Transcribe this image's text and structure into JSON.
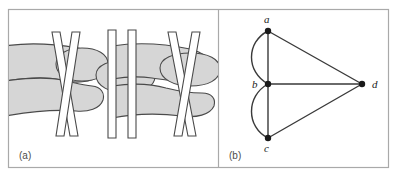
{
  "figure": {
    "border_color": "#a8a8a8",
    "background": "#ffffff"
  },
  "panels": [
    {
      "id": "a",
      "label": "(a)",
      "caption_position": "bottom-left",
      "description": "Shaded band with rounded bulges crossed by white strips",
      "fill_color": "#d6d6d6",
      "stroke_color": "#4a4a4a"
    },
    {
      "id": "b",
      "label": "(b)",
      "caption_position": "bottom-left",
      "description": "Graph with four vertices a, b, c, d and seven edges",
      "node_color": "#1a1a1a",
      "edge_color": "#3a3a3a"
    }
  ],
  "graph": {
    "nodes": [
      {
        "id": "a",
        "label": "a",
        "x": 268,
        "y": 31,
        "label_x": 264,
        "label_y": 22
      },
      {
        "id": "b",
        "label": "b",
        "x": 268,
        "y": 84,
        "label_x": 252,
        "label_y": 88
      },
      {
        "id": "c",
        "label": "c",
        "x": 268,
        "y": 138,
        "label_x": 264,
        "label_y": 151
      },
      {
        "id": "d",
        "label": "d",
        "x": 362,
        "y": 84,
        "label_x": 372,
        "label_y": 88
      }
    ],
    "edges": [
      {
        "from": "a",
        "to": "b",
        "kind": "straight"
      },
      {
        "from": "a",
        "to": "b",
        "kind": "curved",
        "bulge": "left"
      },
      {
        "from": "b",
        "to": "c",
        "kind": "straight"
      },
      {
        "from": "b",
        "to": "c",
        "kind": "curved",
        "bulge": "left"
      },
      {
        "from": "a",
        "to": "d",
        "kind": "straight"
      },
      {
        "from": "b",
        "to": "d",
        "kind": "straight"
      },
      {
        "from": "c",
        "to": "d",
        "kind": "straight"
      }
    ],
    "node_radius": 3.2,
    "edge_width": 1.4
  }
}
